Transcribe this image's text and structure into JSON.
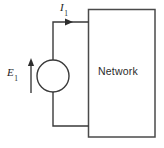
{
  "figure": {
    "type": "circuit-diagram",
    "background_color": "#ffffff",
    "line_color": "#3a3a3a",
    "text_color": "#1d1d1d",
    "width": 164,
    "height": 148
  },
  "labels": {
    "source_symbol": "E",
    "source_subscript": "1",
    "current_symbol": "I",
    "current_subscript": "1",
    "network_label": "Network"
  },
  "components": {
    "voltage_source": {
      "name": "voltage-source",
      "shape": "circle",
      "center_x": 53,
      "center_y": 76,
      "radius": 16
    },
    "network_block": {
      "name": "network-block",
      "shape": "rectangle",
      "x": 88,
      "y": 9,
      "width": 67,
      "height": 128
    },
    "top_wire": {
      "name": "top-wire",
      "from_x": 53,
      "from_y": 22,
      "to_x": 88,
      "to_y": 22
    },
    "bottom_wire": {
      "name": "bottom-wire",
      "from_x": 53,
      "from_y": 126,
      "to_x": 88,
      "to_y": 126
    },
    "current_arrow": {
      "name": "current-arrow",
      "direction": "right",
      "tip_x": 73,
      "y": 22
    },
    "voltage_arrow": {
      "name": "voltage-arrow",
      "direction": "up",
      "x": 31,
      "from_y": 93,
      "to_y": 59
    }
  }
}
